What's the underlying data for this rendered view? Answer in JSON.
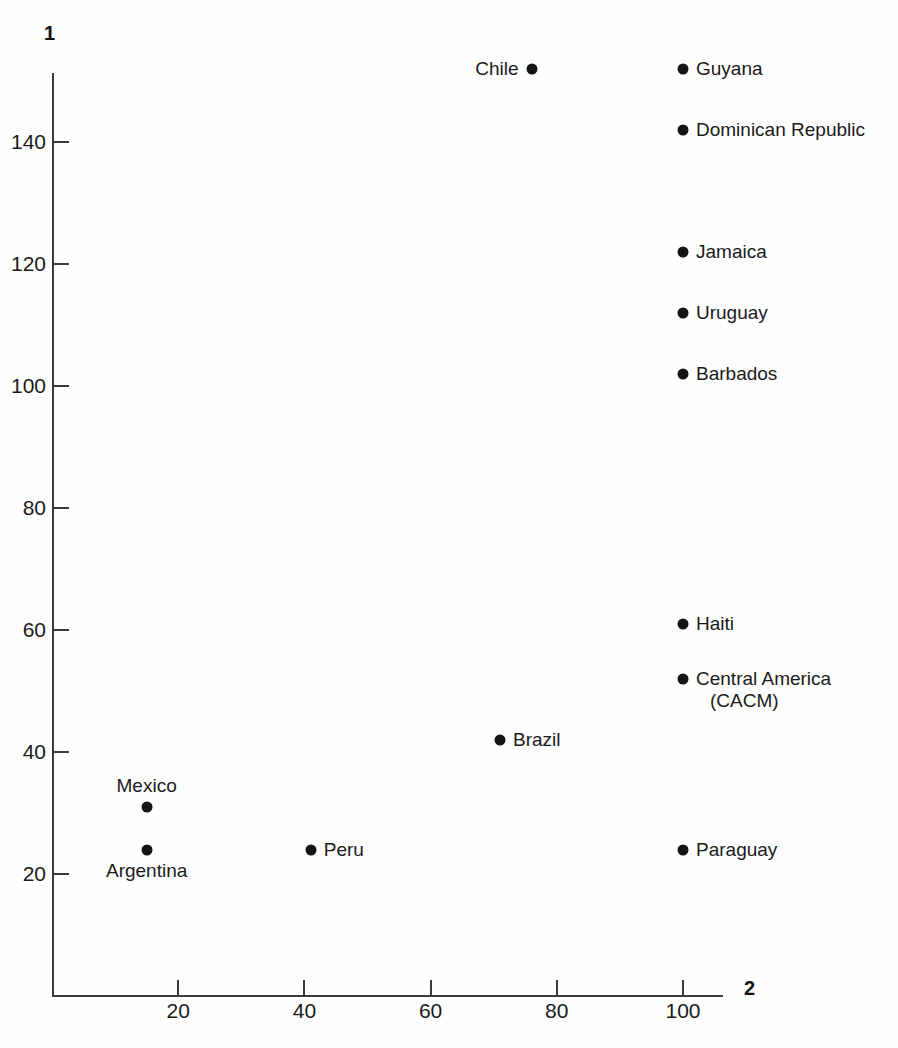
{
  "chart_data": {
    "type": "scatter",
    "title": "",
    "subtitle": "",
    "xlabel": "2",
    "ylabel": "1",
    "xlim": [
      0,
      106
    ],
    "ylim": [
      0,
      155
    ],
    "xticks": [
      20,
      40,
      60,
      80,
      100
    ],
    "yticks": [
      20,
      40,
      60,
      80,
      100,
      120,
      140
    ],
    "xtick_labels": [
      "20",
      "40",
      "60",
      "80",
      "100"
    ],
    "ytick_labels": [
      "20",
      "40",
      "60",
      "80",
      "100",
      "120",
      "140"
    ],
    "grid": false,
    "legend": false,
    "points": [
      {
        "label": "Chile",
        "x": 76,
        "y": 152,
        "label_pos": "left"
      },
      {
        "label": "Guyana",
        "x": 100,
        "y": 152,
        "label_pos": "right"
      },
      {
        "label": "Dominican Republic",
        "x": 100,
        "y": 142,
        "label_pos": "right"
      },
      {
        "label": "Jamaica",
        "x": 100,
        "y": 122,
        "label_pos": "right"
      },
      {
        "label": "Uruguay",
        "x": 100,
        "y": 112,
        "label_pos": "right"
      },
      {
        "label": "Barbados",
        "x": 100,
        "y": 102,
        "label_pos": "right"
      },
      {
        "label": "Haiti",
        "x": 100,
        "y": 61,
        "label_pos": "right"
      },
      {
        "label": "Central America",
        "label_line2": "(CACM)",
        "x": 100,
        "y": 52,
        "label_pos": "twoline"
      },
      {
        "label": "Brazil",
        "x": 71,
        "y": 42,
        "label_pos": "right"
      },
      {
        "label": "Mexico",
        "x": 15,
        "y": 31,
        "label_pos": "above"
      },
      {
        "label": "Argentina",
        "x": 15,
        "y": 24,
        "label_pos": "below"
      },
      {
        "label": "Peru",
        "x": 41,
        "y": 24,
        "label_pos": "right"
      },
      {
        "label": "Paraguay",
        "x": 100,
        "y": 24,
        "label_pos": "right"
      }
    ]
  },
  "colors": {
    "point": "#141414",
    "axis": "#3a3a3a",
    "text": "#1a1a1a",
    "background": "#fefefe"
  }
}
